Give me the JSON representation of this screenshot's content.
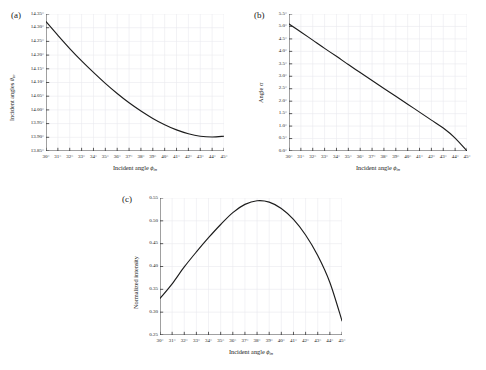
{
  "figure": {
    "background": "#ffffff",
    "curve_color": "#1c1c1c",
    "grid_color": "#e9e9ef",
    "axis_color": "#333333"
  },
  "panels": [
    {
      "key": "a",
      "label": "(a)",
      "chart_data": {
        "type": "line",
        "title": "",
        "xlabel": "Incident angle ϕin",
        "ylabel": "Incident angles θin",
        "xlim": [
          30,
          45
        ],
        "ylim": [
          13.85,
          14.35
        ],
        "grid": true,
        "legend": "none",
        "xticks": [
          "30°",
          "31°",
          "32°",
          "33°",
          "34°",
          "35°",
          "36°",
          "37°",
          "38°",
          "39°",
          "40°",
          "41°",
          "42°",
          "43°",
          "44°",
          "45°"
        ],
        "yticks": [
          "13.85°",
          "13.90°",
          "13.95°",
          "14.00°",
          "14.05°",
          "14.10°",
          "14.15°",
          "14.20°",
          "14.25°",
          "14.30°",
          "14.35°"
        ],
        "x": [
          30,
          31,
          32,
          33,
          34,
          35,
          36,
          37,
          38,
          39,
          40,
          41,
          42,
          43,
          44,
          45
        ],
        "values": [
          14.322,
          14.272,
          14.224,
          14.179,
          14.137,
          14.097,
          14.06,
          14.026,
          13.996,
          13.969,
          13.946,
          13.927,
          13.913,
          13.904,
          13.901,
          13.904
        ]
      }
    },
    {
      "key": "b",
      "label": "(b)",
      "chart_data": {
        "type": "line",
        "title": "",
        "xlabel": "Incident angle ϕin",
        "ylabel": "Angle α",
        "xlim": [
          30,
          45
        ],
        "ylim": [
          0.0,
          5.5
        ],
        "grid": true,
        "legend": "none",
        "xticks": [
          "30°",
          "31°",
          "32°",
          "33°",
          "34°",
          "35°",
          "36°",
          "37°",
          "38°",
          "39°",
          "40°",
          "41°",
          "42°",
          "43°",
          "44°",
          "45°"
        ],
        "yticks": [
          "0.0°",
          "0.5°",
          "1.0°",
          "1.5°",
          "2.0°",
          "2.5°",
          "3.0°",
          "3.5°",
          "4.0°",
          "4.5°",
          "5.0°",
          "5.5°"
        ],
        "x": [
          30,
          31,
          32,
          33,
          34,
          35,
          36,
          37,
          38,
          39,
          40,
          41,
          42,
          43,
          44,
          45
        ],
        "values": [
          5.1,
          4.78,
          4.45,
          4.12,
          3.8,
          3.47,
          3.15,
          2.83,
          2.51,
          2.2,
          1.88,
          1.56,
          1.24,
          0.92,
          0.52,
          0.0
        ]
      }
    },
    {
      "key": "c",
      "label": "(c)",
      "chart_data": {
        "type": "line",
        "title": "",
        "xlabel": "Incident angle ϕin",
        "ylabel": "Normalized intensity",
        "xlim": [
          30,
          45
        ],
        "ylim": [
          0.25,
          0.55
        ],
        "grid": true,
        "legend": "none",
        "xticks": [
          "30°",
          "31°",
          "32°",
          "33°",
          "34°",
          "35°",
          "36°",
          "37°",
          "38°",
          "39°",
          "40°",
          "41°",
          "42°",
          "43°",
          "44°",
          "45°"
        ],
        "yticks": [
          "0.25",
          "0.30",
          "0.35",
          "0.40",
          "0.45",
          "0.50",
          "0.55"
        ],
        "x": [
          30,
          31,
          32,
          33,
          34,
          35,
          36,
          37,
          38,
          39,
          40,
          41,
          42,
          43,
          44,
          45
        ],
        "values": [
          0.33,
          0.362,
          0.399,
          0.432,
          0.463,
          0.492,
          0.518,
          0.536,
          0.544,
          0.541,
          0.527,
          0.503,
          0.469,
          0.424,
          0.365,
          0.281
        ]
      }
    }
  ]
}
